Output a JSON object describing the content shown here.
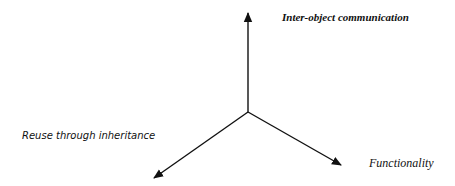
{
  "diagram": {
    "type": "three-axis",
    "colors": {
      "line": "#111111",
      "background": "#ffffff"
    },
    "origin": {
      "x": 248,
      "y": 112
    },
    "axes": [
      {
        "id": "up",
        "label": "Inter-object communication",
        "tip": {
          "x": 248,
          "y": 13
        }
      },
      {
        "id": "down-left",
        "label": "Reuse through inheritance",
        "tip": {
          "x": 154,
          "y": 178
        }
      },
      {
        "id": "down-right",
        "label": "Functionality",
        "tip": {
          "x": 341,
          "y": 165
        }
      }
    ]
  }
}
